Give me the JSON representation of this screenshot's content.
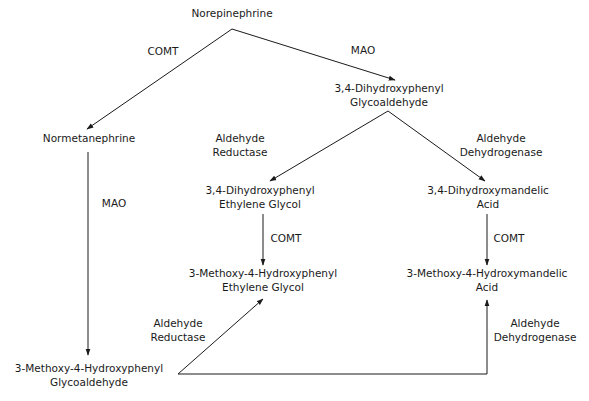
{
  "diagram": {
    "type": "metabolic-pathway",
    "nodes": {
      "norepinephrine": [
        "Norepinephrine"
      ],
      "dhpg_aldehyde": [
        "3,4-Dihydroxyphenyl",
        "Glycoaldehyde"
      ],
      "normetanephrine": [
        "Normetanephrine"
      ],
      "dhpg": [
        "3,4-Dihydroxyphenyl",
        "Ethylene Glycol"
      ],
      "dhma": [
        "3,4-Dihydroxymandelic",
        "Acid"
      ],
      "mhpg": [
        "3-Methoxy-4-Hydroxyphenyl",
        "Ethylene Glycol"
      ],
      "vma": [
        "3-Methoxy-4-Hydroxymandelic",
        "Acid"
      ],
      "mhpg_aldehyde": [
        "3-Methoxy-4-Hydroxyphenyl",
        "Glycoaldehyde"
      ]
    },
    "enzymes": {
      "comt_top": [
        "COMT"
      ],
      "mao_top": [
        "MAO"
      ],
      "aldehyde_reductase_top": [
        "Aldehyde",
        "Reductase"
      ],
      "aldehyde_dehydrogenase_top": [
        "Aldehyde",
        "Dehydrogenase"
      ],
      "mao_left": [
        "MAO"
      ],
      "comt_mid": [
        "COMT"
      ],
      "comt_right": [
        "COMT"
      ],
      "aldehyde_reductase_bottom": [
        "Aldehyde",
        "Reductase"
      ],
      "aldehyde_dehydrogenase_bottom": [
        "Aldehyde",
        "Dehydrogenase"
      ]
    },
    "edges": [
      {
        "from": "Norepinephrine",
        "to": "Normetanephrine",
        "enzyme": "COMT"
      },
      {
        "from": "Norepinephrine",
        "to": "3,4-Dihydroxyphenyl Glycoaldehyde",
        "enzyme": "MAO"
      },
      {
        "from": "3,4-Dihydroxyphenyl Glycoaldehyde",
        "to": "3,4-Dihydroxyphenyl Ethylene Glycol",
        "enzyme": "Aldehyde Reductase"
      },
      {
        "from": "3,4-Dihydroxyphenyl Glycoaldehyde",
        "to": "3,4-Dihydroxymandelic Acid",
        "enzyme": "Aldehyde Dehydrogenase"
      },
      {
        "from": "Normetanephrine",
        "to": "3-Methoxy-4-Hydroxyphenyl Glycoaldehyde",
        "enzyme": "MAO"
      },
      {
        "from": "3,4-Dihydroxyphenyl Ethylene Glycol",
        "to": "3-Methoxy-4-Hydroxyphenyl Ethylene Glycol",
        "enzyme": "COMT"
      },
      {
        "from": "3,4-Dihydroxymandelic Acid",
        "to": "3-Methoxy-4-Hydroxymandelic Acid",
        "enzyme": "COMT"
      },
      {
        "from": "3-Methoxy-4-Hydroxyphenyl Glycoaldehyde",
        "to": "3-Methoxy-4-Hydroxyphenyl Ethylene Glycol",
        "enzyme": "Aldehyde Reductase"
      },
      {
        "from": "3-Methoxy-4-Hydroxyphenyl Glycoaldehyde",
        "to": "3-Methoxy-4-Hydroxymandelic Acid",
        "enzyme": "Aldehyde Dehydrogenase"
      }
    ],
    "colors": {
      "line": "#1a1a1a",
      "background": "#ffffff"
    }
  }
}
